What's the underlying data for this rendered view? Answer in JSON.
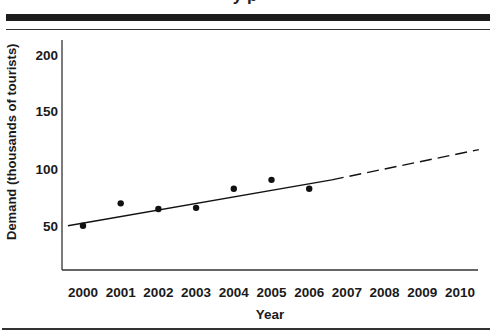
{
  "page": {
    "title_fragment": "y   p"
  },
  "chart_data": {
    "type": "scatter",
    "title": "",
    "xlabel": "Year",
    "ylabel": "Demand (thousands of tourists)",
    "x_ticks": [
      "2000",
      "2001",
      "2002",
      "2003",
      "2004",
      "2005",
      "2006",
      "2007",
      "2008",
      "2009",
      "2010"
    ],
    "y_ticks": [
      "50",
      "100",
      "150",
      "200"
    ],
    "ylim": [
      15,
      215
    ],
    "xlim": [
      1999.5,
      2010.5
    ],
    "grid": false,
    "legend": null,
    "series": [
      {
        "name": "Observed demand",
        "kind": "points",
        "x": [
          2000,
          2001,
          2002,
          2003,
          2004,
          2005,
          2006
        ],
        "y": [
          52,
          72,
          67,
          68,
          85,
          93,
          85
        ]
      },
      {
        "name": "Trend line (fitted)",
        "kind": "line-solid",
        "x": [
          1999.6,
          2006.6
        ],
        "y": [
          52,
          93
        ]
      },
      {
        "name": "Trend line (forecast)",
        "kind": "line-dashed",
        "x": [
          2006.6,
          2010.5
        ],
        "y": [
          93,
          120
        ]
      }
    ]
  }
}
